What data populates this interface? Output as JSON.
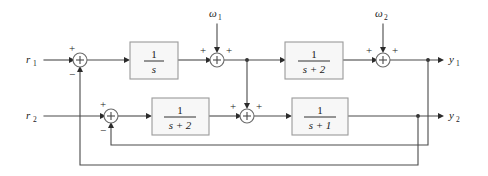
{
  "diagram": {
    "type": "control-block-diagram",
    "colors": {
      "wire": "#4a4a4a",
      "block_fill": "#f7f7f7",
      "block_stroke": "#9a9a9a",
      "text": "#1a1a1a",
      "background": "#ffffff"
    },
    "inputs": [
      {
        "id": "r1",
        "symbol": "r",
        "subscript": "1",
        "x": 32,
        "y": 60
      },
      {
        "id": "r2",
        "symbol": "r",
        "subscript": "2",
        "x": 32,
        "y": 116
      }
    ],
    "disturbances": [
      {
        "id": "w1",
        "symbol": "ω",
        "subscript": "1",
        "x": 217,
        "y": 14
      },
      {
        "id": "w2",
        "symbol": "ω",
        "subscript": "2",
        "x": 383,
        "y": 14
      }
    ],
    "outputs": [
      {
        "id": "y1",
        "symbol": "y",
        "subscript": "1",
        "x": 452,
        "y": 60
      },
      {
        "id": "y2",
        "symbol": "y",
        "subscript": "2",
        "x": 452,
        "y": 116
      }
    ],
    "blocks": [
      {
        "id": "block-1-over-s",
        "numerator": "1",
        "denominator": "s",
        "x": 130,
        "y": 42,
        "w": 48,
        "h": 37
      },
      {
        "id": "block-1-over-s-plus-2-top",
        "numerator": "1",
        "denominator": "s + 2",
        "x": 285,
        "y": 42,
        "w": 58,
        "h": 37
      },
      {
        "id": "block-1-over-s-plus-2-bottom",
        "numerator": "1",
        "denominator": "s + 2",
        "x": 152,
        "y": 98,
        "w": 57,
        "h": 37
      },
      {
        "id": "block-1-over-s-plus-1",
        "numerator": "1",
        "denominator": "s + 1",
        "x": 292,
        "y": 98,
        "w": 56,
        "h": 37
      }
    ],
    "summing_junctions": [
      {
        "id": "sum-1",
        "cx": 80,
        "cy": 60,
        "r": 7,
        "signs": [
          {
            "label": "+",
            "x": 69,
            "y": 48
          },
          {
            "label": "−",
            "x": 69,
            "y": 74
          }
        ]
      },
      {
        "id": "sum-2",
        "cx": 217,
        "cy": 60,
        "r": 7,
        "signs": [
          {
            "label": "+",
            "x": 203,
            "y": 51
          },
          {
            "label": "+",
            "x": 229,
            "y": 51
          }
        ]
      },
      {
        "id": "sum-3",
        "cx": 383,
        "cy": 60,
        "r": 7,
        "signs": [
          {
            "label": "+",
            "x": 369,
            "y": 51
          },
          {
            "label": "+",
            "x": 395,
            "y": 51
          }
        ]
      },
      {
        "id": "sum-4",
        "cx": 111,
        "cy": 116,
        "r": 7,
        "signs": [
          {
            "label": "+",
            "x": 100,
            "y": 104
          },
          {
            "label": "−",
            "x": 100,
            "y": 130
          }
        ]
      },
      {
        "id": "sum-5",
        "cx": 247,
        "cy": 116,
        "r": 7,
        "signs": [
          {
            "label": "+",
            "x": 233,
            "y": 107
          },
          {
            "label": "+",
            "x": 259,
            "y": 107
          }
        ]
      }
    ],
    "feedback_paths": [
      {
        "id": "feedback-y1-to-sum4",
        "description": "y1 branch at x=428 down to y=145 then left to sum-4 negative input"
      },
      {
        "id": "feedback-y2-to-sum1",
        "description": "y2 branch at x=418 down to y=165 then left to sum-1 negative input"
      },
      {
        "id": "crossfeed-sum1-out-to-sum5",
        "description": "signal after sum-2 at x=247 drops to sum-5 positive input"
      }
    ]
  }
}
